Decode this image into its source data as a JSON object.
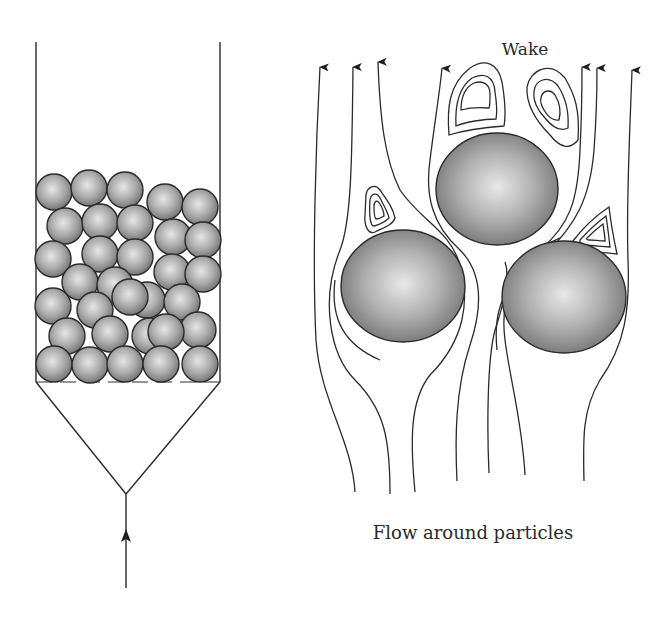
{
  "figure": {
    "labels": {
      "wake": "Wake",
      "caption": "Flow around particles"
    },
    "colors": {
      "line": "#2b2b2b",
      "particle_center": "#e4e4e4",
      "particle_mid": "#a9a9a9",
      "particle_edge": "#6f6f6f",
      "background": "#ffffff"
    },
    "packed_bed": {
      "column_walls": {
        "left_x": 36,
        "right_x": 220,
        "top_y": 42,
        "bottom_y": 382
      },
      "cone_apex": [
        126,
        494
      ],
      "inlet": {
        "x": 126,
        "top_y": 494,
        "bottom_y": 588,
        "arrow_y": 536
      },
      "distributor_y": 382,
      "particle_radius": 18,
      "particles": [
        [
          54,
          192
        ],
        [
          89,
          188
        ],
        [
          125,
          190
        ],
        [
          165,
          202
        ],
        [
          200,
          207
        ],
        [
          65,
          226
        ],
        [
          100,
          222
        ],
        [
          135,
          223
        ],
        [
          173,
          237
        ],
        [
          203,
          240
        ],
        [
          53,
          259
        ],
        [
          100,
          254
        ],
        [
          135,
          257
        ],
        [
          172,
          272
        ],
        [
          203,
          274
        ],
        [
          80,
          282
        ],
        [
          115,
          285
        ],
        [
          147,
          300
        ],
        [
          182,
          302
        ],
        [
          53,
          306
        ],
        [
          95,
          310
        ],
        [
          130,
          297
        ],
        [
          67,
          336
        ],
        [
          110,
          334
        ],
        [
          150,
          336
        ],
        [
          198,
          330
        ],
        [
          166,
          332
        ],
        [
          54,
          364
        ],
        [
          90,
          365
        ],
        [
          125,
          364
        ],
        [
          161,
          364
        ],
        [
          200,
          364
        ]
      ]
    },
    "flow_diagram": {
      "spheres": [
        {
          "id": "top",
          "cx": 497,
          "cy": 189,
          "rx": 61,
          "ry": 56
        },
        {
          "id": "left",
          "cx": 403,
          "cy": 286,
          "rx": 62,
          "ry": 56
        },
        {
          "id": "right",
          "cx": 564,
          "cy": 297,
          "rx": 62,
          "ry": 56
        }
      ],
      "streamline_count": 10,
      "wake_vortex_count": 4
    }
  }
}
